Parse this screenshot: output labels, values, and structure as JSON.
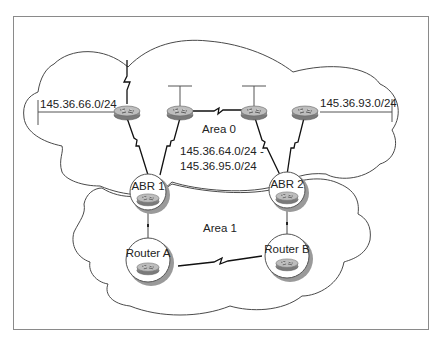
{
  "diagram": {
    "areas": [
      {
        "id": "area0",
        "label": "Area 0",
        "summary_line1": "145.36.64.0/24 -",
        "summary_line2": "145.36.95.0/24"
      },
      {
        "id": "area1",
        "label": "Area 1"
      }
    ],
    "networks": [
      {
        "id": "net-left",
        "label": "145.36.66.0/24"
      },
      {
        "id": "net-right",
        "label": "145.36.93.0/24"
      }
    ],
    "nodes": [
      {
        "id": "abr1",
        "label": "ABR 1",
        "type": "area-border-router"
      },
      {
        "id": "abr2",
        "label": "ABR 2",
        "type": "area-border-router"
      },
      {
        "id": "router-a",
        "label": "Router A",
        "type": "router"
      },
      {
        "id": "router-b",
        "label": "Router B",
        "type": "router"
      },
      {
        "id": "r-area0-1",
        "label": "",
        "type": "router"
      },
      {
        "id": "r-area0-2",
        "label": "",
        "type": "router"
      },
      {
        "id": "r-area0-3",
        "label": "",
        "type": "router"
      },
      {
        "id": "r-area0-4",
        "label": "",
        "type": "router"
      }
    ],
    "links": [
      {
        "from": "r-area0-1",
        "to": "abr1",
        "type": "serial"
      },
      {
        "from": "r-area0-2",
        "to": "abr1",
        "type": "serial"
      },
      {
        "from": "r-area0-2",
        "to": "r-area0-3",
        "type": "serial"
      },
      {
        "from": "r-area0-3",
        "to": "abr2",
        "type": "serial"
      },
      {
        "from": "r-area0-4",
        "to": "abr2",
        "type": "serial"
      },
      {
        "from": "abr1",
        "to": "router-a",
        "type": "ethernet"
      },
      {
        "from": "abr2",
        "to": "router-b",
        "type": "ethernet"
      },
      {
        "from": "router-a",
        "to": "router-b",
        "type": "serial"
      }
    ],
    "colors": {
      "frame": "#8a8a8a",
      "line": "#444444",
      "router_body": "#8c8c8c",
      "router_top": "#b8b8b8"
    }
  }
}
